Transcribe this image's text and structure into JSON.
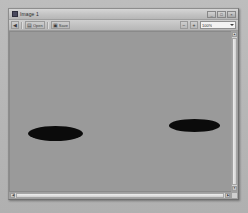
{
  "window": {
    "title": "Image 1",
    "icon": "app-icon",
    "controls": [
      {
        "name": "minimize",
        "glyph": "_"
      },
      {
        "name": "maximize",
        "glyph": "□"
      },
      {
        "name": "close",
        "glyph": "×"
      }
    ]
  },
  "toolbar": {
    "back": {
      "label": "",
      "glyph": "◀"
    },
    "open": {
      "label": "Open",
      "glyph": "▤"
    },
    "save": {
      "label": "Save",
      "glyph": "▣"
    },
    "zoom_out": {
      "glyph": "−"
    },
    "zoom_in": {
      "glyph": "+"
    },
    "zoom_value": "100%",
    "zoom_arrow": "chevron-down-icon"
  },
  "canvas": {
    "background_color": "#9a9a9a",
    "shapes": [
      {
        "name": "blob-left",
        "left_pct": 8.0,
        "top_pct": 59.0,
        "width_pct": 25.0,
        "height_pct": 9.5,
        "color": "#0b0b0b"
      },
      {
        "name": "blob-right",
        "left_pct": 72.0,
        "top_pct": 55.0,
        "width_pct": 23.0,
        "height_pct": 8.0,
        "color": "#0b0b0b"
      }
    ]
  },
  "scrollbars": {
    "vertical": {
      "up": "▲",
      "down": "▼"
    },
    "horizontal": {
      "left": "◀",
      "right": "▶"
    }
  }
}
